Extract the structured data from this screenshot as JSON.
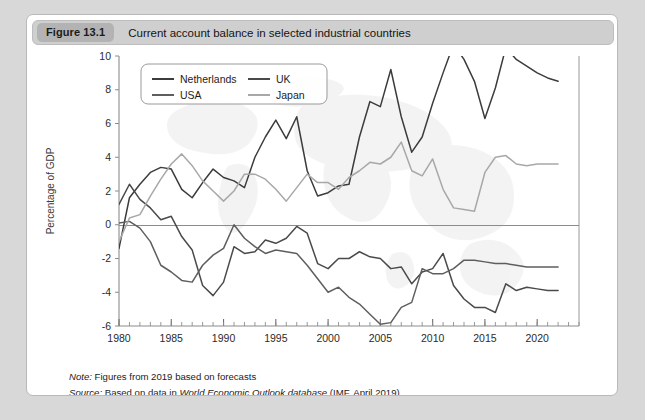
{
  "figure": {
    "badge": "Figure 13.1",
    "title": "Current account balance in selected industrial countries"
  },
  "footnotes": {
    "note_label": "Note:",
    "note_text": "Figures from 2019 based on forecasts",
    "source_label": "Source:",
    "source_prefix": "Based on data in",
    "source_italic": "World Economic Outlook database",
    "source_suffix": "(IMF, April 2019)"
  },
  "colors": {
    "netherlands": "#3c3c3c",
    "uk": "#4a4a4a",
    "usa": "#5e5e5e",
    "japan": "#a8a8a8",
    "axis": "#8c8c8c",
    "zero_line": "#8c8c8c",
    "card_background": "#ffffff",
    "page_background": "#d8d8d8",
    "header_background": "#cfcfcf",
    "badge_background": "#b3b3b3"
  },
  "chart_data": {
    "type": "line",
    "title": "Current account balance in selected industrial countries",
    "xlabel": "",
    "ylabel": "Percentage of GDP",
    "xlim": [
      1980,
      2024
    ],
    "ylim": [
      -6,
      10
    ],
    "ytick_step": 2,
    "yticks": [
      -6,
      -4,
      -2,
      0,
      2,
      4,
      6,
      8,
      10
    ],
    "xticks": [
      1980,
      1985,
      1990,
      1995,
      2000,
      2005,
      2010,
      2015,
      2020
    ],
    "xtick_labels": [
      "1980",
      "1985",
      "1990",
      "1995",
      "2000",
      "2005",
      "2010",
      "2015",
      "2020"
    ],
    "ytick_labels": [
      "-6",
      "-4",
      "-2",
      "0",
      "2",
      "4",
      "6",
      "8",
      "10"
    ],
    "minor_xticks_every": 1,
    "grid": false,
    "legend_position": "top-left",
    "x": [
      1980,
      1981,
      1982,
      1983,
      1984,
      1985,
      1986,
      1987,
      1988,
      1989,
      1990,
      1991,
      1992,
      1993,
      1994,
      1995,
      1996,
      1997,
      1998,
      1999,
      2000,
      2001,
      2002,
      2003,
      2004,
      2005,
      2006,
      2007,
      2008,
      2009,
      2010,
      2011,
      2012,
      2013,
      2014,
      2015,
      2016,
      2017,
      2018,
      2019,
      2020,
      2021,
      2022
    ],
    "series": [
      {
        "name": "Netherlands",
        "color": "#3c3c3c",
        "values": [
          -1.4,
          1.6,
          2.4,
          3.1,
          3.4,
          3.3,
          2.1,
          1.6,
          2.5,
          3.3,
          2.8,
          2.6,
          2.2,
          4.0,
          5.2,
          6.2,
          5.1,
          6.4,
          3.2,
          1.7,
          1.9,
          2.3,
          2.4,
          5.2,
          7.3,
          7.0,
          9.2,
          6.4,
          4.3,
          5.2,
          7.2,
          9.0,
          10.7,
          9.8,
          8.5,
          6.3,
          8.1,
          10.5,
          9.8,
          9.4,
          9.0,
          8.7,
          8.5
        ]
      },
      {
        "name": "UK",
        "color": "#4a4a4a",
        "values": [
          1.2,
          2.4,
          1.5,
          1.0,
          0.3,
          0.5,
          -0.7,
          -1.5,
          -3.6,
          -4.2,
          -3.4,
          -1.3,
          -1.7,
          -1.6,
          -0.9,
          -1.1,
          -0.8,
          -0.1,
          -0.5,
          -2.3,
          -2.6,
          -2.0,
          -2.0,
          -1.6,
          -1.9,
          -2.0,
          -2.6,
          -2.5,
          -3.5,
          -2.8,
          -2.6,
          -1.7,
          -3.6,
          -4.4,
          -4.9,
          -4.9,
          -5.2,
          -3.5,
          -3.9,
          -3.7,
          -3.8,
          -3.9,
          -3.9
        ]
      },
      {
        "name": "USA",
        "color": "#5e5e5e",
        "values": [
          0.1,
          0.2,
          -0.2,
          -1.0,
          -2.4,
          -2.8,
          -3.3,
          -3.4,
          -2.4,
          -1.8,
          -1.4,
          0.0,
          -0.8,
          -1.3,
          -1.7,
          -1.5,
          -1.6,
          -1.7,
          -2.4,
          -3.2,
          -4.0,
          -3.7,
          -4.3,
          -4.7,
          -5.3,
          -5.9,
          -5.8,
          -4.9,
          -4.6,
          -2.6,
          -2.9,
          -2.9,
          -2.6,
          -2.1,
          -2.1,
          -2.2,
          -2.3,
          -2.3,
          -2.4,
          -2.5,
          -2.5,
          -2.5,
          -2.5
        ]
      },
      {
        "name": "Japan",
        "color": "#a8a8a8",
        "values": [
          -1.0,
          0.4,
          0.6,
          1.7,
          2.7,
          3.6,
          4.2,
          3.5,
          2.6,
          2.0,
          1.4,
          2.0,
          3.0,
          3.0,
          2.7,
          2.1,
          1.4,
          2.2,
          3.0,
          2.5,
          2.5,
          2.1,
          2.8,
          3.2,
          3.7,
          3.6,
          4.0,
          4.9,
          3.2,
          2.9,
          3.9,
          2.1,
          1.0,
          0.9,
          0.8,
          3.1,
          4.0,
          4.1,
          3.6,
          3.5,
          3.6,
          3.6,
          3.6
        ]
      }
    ]
  }
}
